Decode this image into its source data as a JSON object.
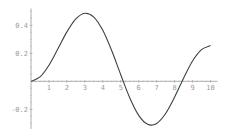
{
  "chart_data": {
    "type": "line",
    "title": "",
    "xlabel": "",
    "ylabel": "",
    "xlim": [
      0,
      10
    ],
    "ylim": [
      -0.32,
      0.49
    ],
    "grid": false,
    "legend": null,
    "x_ticks": [
      "1",
      "2",
      "3",
      "4",
      "5",
      "6",
      "7",
      "8",
      "9",
      "10"
    ],
    "y_ticks": [
      "0.4",
      "0.2",
      "-0.2"
    ],
    "series": [
      {
        "name": "curve",
        "x": [
          0,
          0.5,
          1,
          1.5,
          2,
          2.5,
          3,
          3.5,
          4,
          4.5,
          5,
          5.5,
          6,
          6.5,
          7,
          7.5,
          8,
          8.5,
          9,
          9.5,
          10
        ],
        "values": [
          0,
          0.031,
          0.115,
          0.232,
          0.353,
          0.446,
          0.486,
          0.459,
          0.364,
          0.218,
          0.047,
          -0.117,
          -0.243,
          -0.307,
          -0.301,
          -0.23,
          -0.113,
          0.022,
          0.145,
          0.226,
          0.255
        ]
      }
    ],
    "line_color": "#404040",
    "axis_color": "#9a9a9a"
  }
}
